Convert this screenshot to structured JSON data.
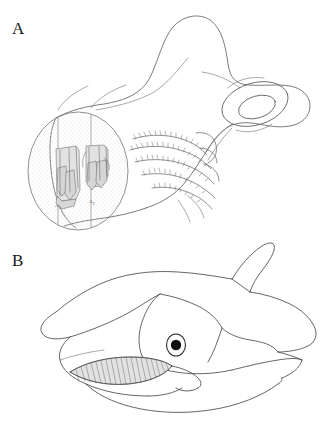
{
  "figure": {
    "background_color": "#ffffff",
    "width": 336,
    "height": 427,
    "line_color": "#5a5a5e",
    "shade_color": "#e2e2e2",
    "stipple_color": "#ededed"
  },
  "panels": [
    {
      "letter": "A",
      "name": "chondrocranium-branchial-skeleton",
      "inset": {
        "shape": "ellipse",
        "texture": "stipple",
        "section_labels": [
          {
            "base": "A",
            "sub": "1"
          },
          {
            "base": "A",
            "sub": "2"
          }
        ]
      }
    },
    {
      "letter": "B",
      "name": "lateral-head-reconstruction",
      "features": [
        "snout",
        "eye",
        "gill-rakers",
        "dorsal-fin",
        "lower-jaw"
      ]
    }
  ],
  "caption": {
    "text": ""
  }
}
